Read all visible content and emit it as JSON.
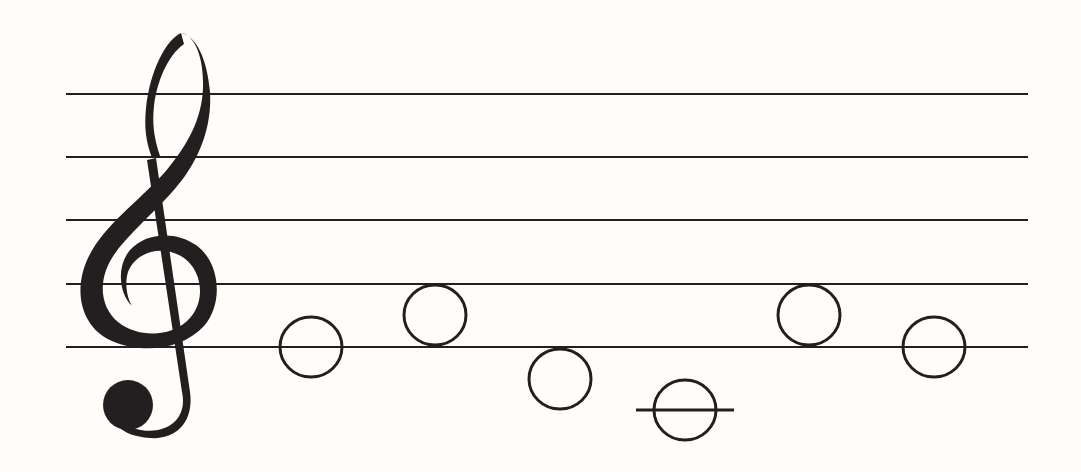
{
  "figure": {
    "type": "music-staff",
    "background": "#fefdf9",
    "ink_color": "#231f20",
    "clef": {
      "name": "treble-clef"
    },
    "staff": {
      "line_count": 5,
      "x_start": 66,
      "x_end": 1028,
      "line_y": [
        94,
        157,
        220,
        284,
        347
      ],
      "line_width": 2
    },
    "notes": [
      {
        "type": "whole-note",
        "cx": 311,
        "cy": 347,
        "position": "on-line-5"
      },
      {
        "type": "whole-note",
        "cx": 435,
        "cy": 315,
        "position": "space-4"
      },
      {
        "type": "whole-note",
        "cx": 560,
        "cy": 379,
        "position": "below-staff"
      },
      {
        "type": "whole-note",
        "cx": 685,
        "cy": 410,
        "position": "ledger-line-1",
        "ledger": {
          "x1": 636,
          "x2": 734
        }
      },
      {
        "type": "whole-note",
        "cx": 809,
        "cy": 315,
        "position": "space-4"
      },
      {
        "type": "whole-note",
        "cx": 934,
        "cy": 347,
        "position": "on-line-5"
      }
    ],
    "note_rx": 31,
    "note_ry": 30,
    "note_stroke": 3
  }
}
